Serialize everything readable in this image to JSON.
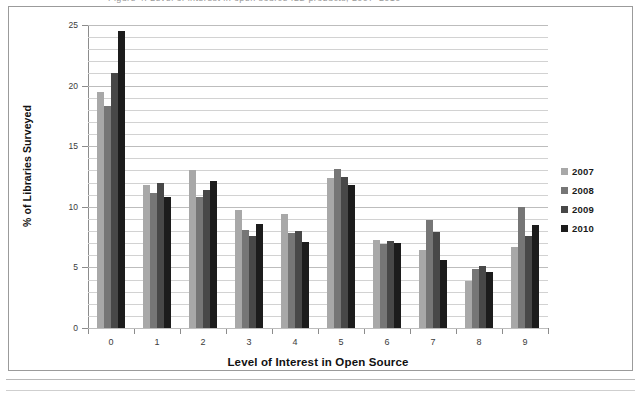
{
  "figure": {
    "top_remnant_text": "Figure 4.  Level of interest in open source ILS products, 2007–2010"
  },
  "chart_data": {
    "type": "bar",
    "title": "",
    "xlabel": "Level of Interest in Open Source",
    "ylabel": "% of Libraries Surveyed",
    "categories": [
      "0",
      "1",
      "2",
      "3",
      "4",
      "5",
      "6",
      "7",
      "8",
      "9"
    ],
    "series": [
      {
        "name": "2007",
        "color": "#a8a8a8",
        "values": [
          19.5,
          11.8,
          13.0,
          9.7,
          9.4,
          12.4,
          7.3,
          6.4,
          3.9,
          6.7
        ]
      },
      {
        "name": "2008",
        "color": "#767676",
        "values": [
          18.3,
          11.1,
          10.8,
          8.1,
          7.8,
          13.1,
          6.9,
          8.9,
          4.9,
          10.0
        ]
      },
      {
        "name": "2009",
        "color": "#484848",
        "values": [
          21.0,
          12.0,
          11.4,
          7.6,
          8.0,
          12.5,
          7.2,
          7.9,
          5.1,
          7.6
        ]
      },
      {
        "name": "2010",
        "color": "#1c1c1c",
        "values": [
          24.5,
          10.8,
          12.1,
          8.6,
          7.1,
          11.8,
          7.0,
          5.6,
          4.6,
          8.5
        ]
      }
    ],
    "ylim": [
      0,
      25
    ],
    "ytick_labels": [
      "0",
      "5",
      "10",
      "15",
      "20",
      "25"
    ],
    "ytick_values": [
      0,
      5,
      10,
      15,
      20,
      25
    ],
    "minor_gridline_step": 1,
    "grid": true,
    "legend_position": "right",
    "legend_entries": [
      "2007",
      "2008",
      "2009",
      "2010"
    ]
  }
}
